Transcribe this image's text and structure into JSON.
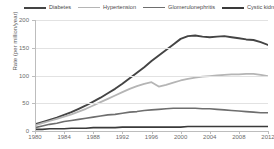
{
  "chart_data": {
    "type": "line",
    "title": "",
    "xlabel": "",
    "ylabel": "Rate (per million/year)",
    "xlim": [
      1980,
      2012
    ],
    "ylim": [
      0,
      200
    ],
    "grid": true,
    "legend_position": "top",
    "yticks": [
      0,
      50,
      100,
      150,
      200
    ],
    "xticks": [
      1980,
      1984,
      1988,
      1992,
      1996,
      2000,
      2004,
      2008,
      2012
    ],
    "x": [
      1980,
      1981,
      1982,
      1983,
      1984,
      1985,
      1986,
      1987,
      1988,
      1989,
      1990,
      1991,
      1992,
      1993,
      1994,
      1995,
      1996,
      1997,
      1998,
      1999,
      2000,
      2001,
      2002,
      2003,
      2004,
      2005,
      2006,
      2007,
      2008,
      2009,
      2010,
      2011,
      2012
    ],
    "series": [
      {
        "name": "Diabetes",
        "color": "#444444",
        "width": 1.9,
        "values": [
          12,
          16,
          20,
          24,
          29,
          34,
          40,
          46,
          53,
          60,
          68,
          76,
          85,
          95,
          105,
          115,
          126,
          136,
          146,
          156,
          166,
          171,
          172,
          170,
          169,
          170,
          171,
          169,
          167,
          165,
          164,
          160,
          155
        ]
      },
      {
        "name": "Hypertension",
        "color": "#b5b5b5",
        "width": 1.8,
        "values": [
          10,
          14,
          18,
          22,
          26,
          30,
          35,
          40,
          46,
          52,
          58,
          64,
          70,
          76,
          81,
          85,
          88,
          80,
          83,
          87,
          91,
          94,
          96,
          98,
          99,
          100,
          101,
          102,
          102,
          103,
          103,
          101,
          99
        ]
      },
      {
        "name": "Glomerulonephritis",
        "color": "#6e6e6e",
        "width": 1.6,
        "values": [
          6,
          9,
          12,
          14,
          17,
          19,
          21,
          23,
          25,
          27,
          29,
          30,
          32,
          34,
          35,
          37,
          38,
          39,
          40,
          41,
          41,
          41,
          41,
          40,
          40,
          39,
          38,
          37,
          36,
          35,
          34,
          33,
          33
        ]
      },
      {
        "name": "Cystic kidney",
        "color": "#3a3a3a",
        "width": 1.6,
        "values": [
          3,
          3,
          4,
          4,
          4,
          5,
          5,
          5,
          6,
          6,
          6,
          6,
          7,
          7,
          7,
          7,
          7,
          7,
          7,
          7,
          7,
          8,
          8,
          8,
          8,
          8,
          8,
          8,
          8,
          8,
          8,
          8,
          8
        ]
      }
    ]
  },
  "legend": {
    "items": [
      {
        "label": "Diabetes",
        "color": "#444444",
        "width": 2
      },
      {
        "label": "Hypertension",
        "color": "#b5b5b5",
        "width": 1.6
      },
      {
        "label": "Glomerulonephritis",
        "color": "#6e6e6e",
        "width": 1.6
      },
      {
        "label": "Cystic kidney",
        "color": "#3a3a3a",
        "width": 2
      }
    ]
  },
  "axes": {
    "y_title": "Rate (per million/year)",
    "y_labels": [
      "200",
      "150",
      "100",
      "50",
      "0"
    ],
    "x_labels": [
      "1980",
      "1984",
      "1988",
      "1992",
      "1996",
      "2000",
      "2004",
      "2008",
      "2012"
    ]
  }
}
